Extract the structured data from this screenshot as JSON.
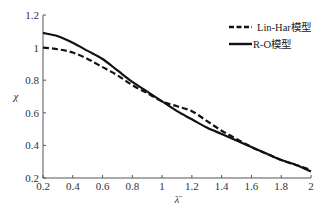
{
  "chart_data": {
    "type": "line",
    "title": "",
    "xlabel": "λ̄",
    "ylabel": "χ",
    "xlim": [
      0.2,
      2.0
    ],
    "ylim": [
      0.2,
      1.2
    ],
    "xticks": [
      0.2,
      0.4,
      0.6,
      0.8,
      1,
      1.2,
      1.4,
      1.6,
      1.8,
      2
    ],
    "yticks": [
      0.2,
      0.4,
      0.6,
      0.8,
      1,
      1.2
    ],
    "xtick_labels": [
      "0.2",
      "0.4",
      "0.6",
      "0.8",
      "1",
      "1.2",
      "1.4",
      "1.6",
      "1.8",
      "2"
    ],
    "ytick_labels": [
      "0.2",
      "0.4",
      "0.6",
      "0.8",
      "1",
      "1.2"
    ],
    "grid": false,
    "legend_position": "upper right",
    "series": [
      {
        "name": "Lin-Har模型",
        "style": "dashed",
        "x": [
          0.2,
          0.3,
          0.4,
          0.5,
          0.6,
          0.7,
          0.8,
          0.9,
          1.0,
          1.1,
          1.2,
          1.3,
          1.4,
          1.5,
          1.6,
          1.7,
          1.8,
          1.9,
          2.0
        ],
        "y": [
          1.0,
          0.99,
          0.97,
          0.93,
          0.88,
          0.83,
          0.77,
          0.72,
          0.67,
          0.64,
          0.61,
          0.55,
          0.49,
          0.44,
          0.39,
          0.35,
          0.31,
          0.28,
          0.25
        ]
      },
      {
        "name": "R-O模型",
        "style": "solid",
        "x": [
          0.2,
          0.3,
          0.4,
          0.5,
          0.6,
          0.7,
          0.8,
          0.9,
          1.0,
          1.1,
          1.2,
          1.3,
          1.4,
          1.5,
          1.6,
          1.7,
          1.8,
          1.9,
          2.0
        ],
        "y": [
          1.09,
          1.07,
          1.03,
          0.98,
          0.93,
          0.86,
          0.79,
          0.73,
          0.67,
          0.61,
          0.56,
          0.51,
          0.47,
          0.43,
          0.39,
          0.35,
          0.31,
          0.28,
          0.24
        ]
      }
    ]
  }
}
